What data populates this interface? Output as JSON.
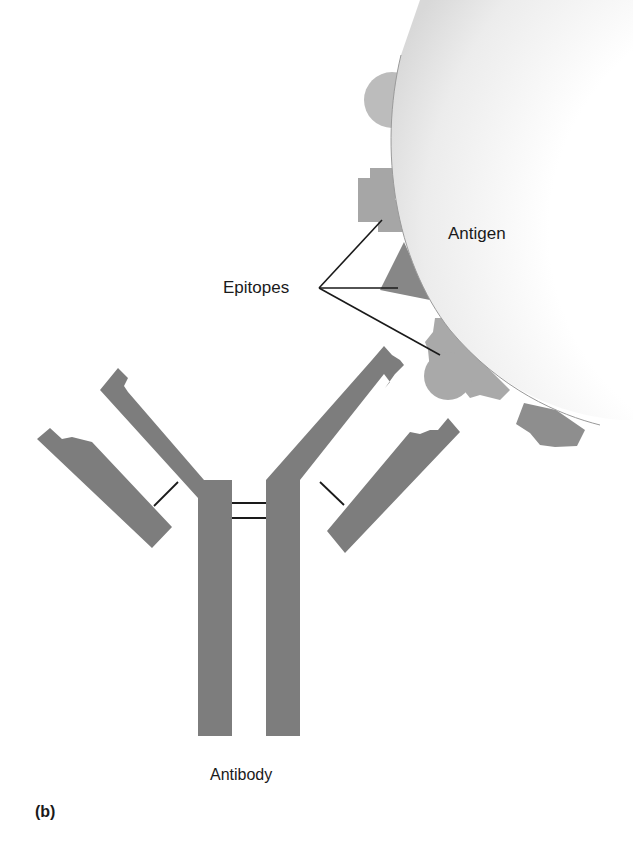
{
  "figure": {
    "panel_label": "(b)",
    "labels": {
      "antigen": "Antigen",
      "epitopes": "Epitopes",
      "antibody": "Antibody"
    },
    "colors": {
      "antibody_fill": "#7d7d7d",
      "epitope_light": "#b4b4b4",
      "epitope_dark": "#8a8a8a",
      "antigen_fill": "#e6e6e6",
      "line": "#1a1a1a",
      "background": "#ffffff"
    },
    "structure": {
      "antibody": {
        "heavy_chains": 2,
        "light_chains": 2,
        "interchain_disulfide_bonds": 2,
        "heavy_light_links": 2
      },
      "epitopes_pointed": 3
    }
  }
}
